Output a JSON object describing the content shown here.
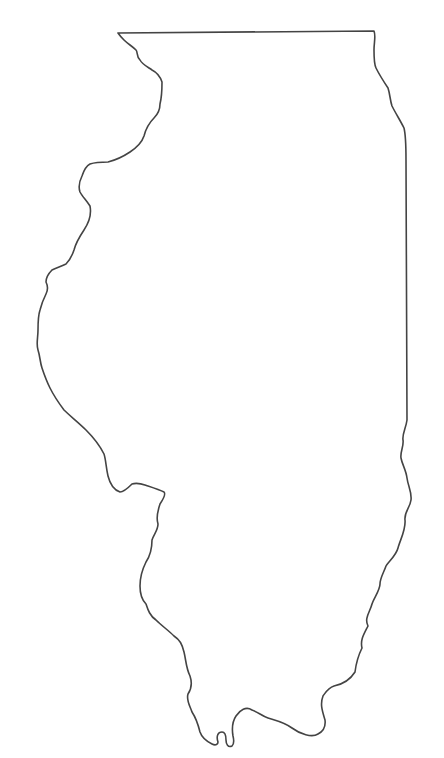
{
  "map": {
    "subject": "Illinois state outline",
    "style": "blank outline",
    "stroke_color": "#444444",
    "background_color": "#ffffff",
    "labels": []
  }
}
